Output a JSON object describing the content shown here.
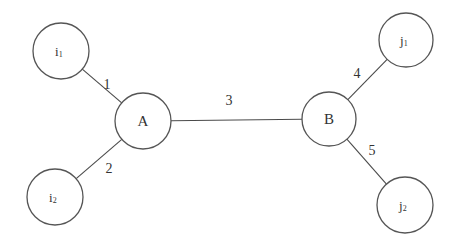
{
  "diagram": {
    "type": "network-graph",
    "colors": {
      "stroke": "#555555",
      "edge": "#4a4a4a",
      "text": "#333333",
      "background": "#ffffff"
    },
    "nodes": [
      {
        "id": "i1",
        "base": "i",
        "sub": "1",
        "cx": 61,
        "cy": 51,
        "r": 28
      },
      {
        "id": "i2",
        "base": "i",
        "sub": "2",
        "cx": 55,
        "cy": 197,
        "r": 28
      },
      {
        "id": "A",
        "base": "A",
        "sub": "",
        "cx": 143,
        "cy": 121,
        "r": 28
      },
      {
        "id": "B",
        "base": "B",
        "sub": "",
        "cx": 329,
        "cy": 119,
        "r": 27
      },
      {
        "id": "j1",
        "base": "j",
        "sub": "1",
        "cx": 406,
        "cy": 40,
        "r": 27
      },
      {
        "id": "j2",
        "base": "j",
        "sub": "2",
        "cx": 405,
        "cy": 205,
        "r": 28
      }
    ],
    "edges": [
      {
        "id": "1",
        "label": "1",
        "from": "i1",
        "to": "A",
        "label_x": 107,
        "label_y": 89
      },
      {
        "id": "2",
        "label": "2",
        "from": "i2",
        "to": "A",
        "label_x": 109,
        "label_y": 173
      },
      {
        "id": "3",
        "label": "3",
        "from": "A",
        "to": "B",
        "label_x": 229,
        "label_y": 105
      },
      {
        "id": "4",
        "label": "4",
        "from": "B",
        "to": "j1",
        "label_x": 357,
        "label_y": 78
      },
      {
        "id": "5",
        "label": "5",
        "from": "B",
        "to": "j2",
        "label_x": 372,
        "label_y": 155
      }
    ]
  }
}
